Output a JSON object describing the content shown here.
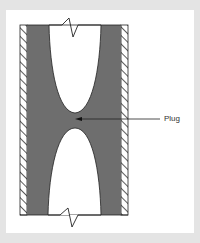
{
  "diagram": {
    "annotations": [
      {
        "label": "Plug",
        "target": "narrow gray region between the two voids"
      }
    ],
    "components": [
      "pipe wall (hatched, left)",
      "pipe wall (hatched, right)",
      "material fill",
      "upper void",
      "lower void",
      "break symbol top",
      "break symbol bottom"
    ],
    "colors": {
      "background": "#e4e4e4",
      "panel": "#ffffff",
      "fill": "#6e6e6e",
      "void": "#ffffff",
      "line": "#222222"
    }
  }
}
